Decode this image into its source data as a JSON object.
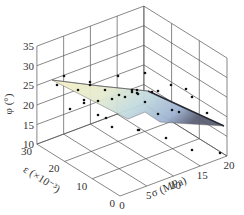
{
  "chart_data": {
    "type": "surface3d",
    "title": "",
    "zlabel": "φ (°)",
    "xlabel": "σ (MPa)",
    "ylabel": "ε (×10⁻³)",
    "z_ticks": [
      "10",
      "15",
      "20",
      "25",
      "30",
      "35"
    ],
    "x_ticks": [
      "0",
      "5",
      "10",
      "15",
      "20"
    ],
    "y_ticks": [
      "0",
      "10",
      "20",
      "30"
    ],
    "zlim": [
      10,
      35
    ],
    "xlim": [
      0,
      20
    ],
    "ylim": [
      0,
      30
    ],
    "grid": true,
    "surface_description": "Wedge-shaped fitted surface, φ ≈ 26° at high ε / low σ, decreasing to ≈ 20° at high σ; colored yellow-to-blue gradient",
    "surface_colors": [
      "#f6f0c8",
      "#cfe3dc",
      "#9fb9d6",
      "#3b3b4a"
    ],
    "scatter_points_px": [
      [
        64,
        76
      ],
      [
        57,
        85
      ],
      [
        90,
        82
      ],
      [
        90,
        85
      ],
      [
        118,
        76
      ],
      [
        78,
        90
      ],
      [
        84,
        100
      ],
      [
        84,
        103
      ],
      [
        70,
        109
      ],
      [
        98,
        101
      ],
      [
        112,
        99
      ],
      [
        105,
        90
      ],
      [
        98,
        115
      ],
      [
        106,
        118
      ],
      [
        112,
        127
      ],
      [
        138,
        130
      ],
      [
        119,
        95
      ],
      [
        125,
        97
      ],
      [
        132,
        90
      ],
      [
        137,
        90
      ],
      [
        138,
        94
      ],
      [
        145,
        73
      ],
      [
        171,
        85
      ],
      [
        186,
        89
      ],
      [
        192,
        97
      ],
      [
        207,
        113
      ],
      [
        172,
        110
      ],
      [
        145,
        102
      ],
      [
        158,
        114
      ],
      [
        139,
        130
      ],
      [
        166,
        138
      ],
      [
        192,
        150
      ],
      [
        220,
        153
      ],
      [
        132,
        92
      ],
      [
        137,
        93
      ],
      [
        152,
        92
      ],
      [
        158,
        91
      ],
      [
        179,
        112
      ]
    ]
  }
}
